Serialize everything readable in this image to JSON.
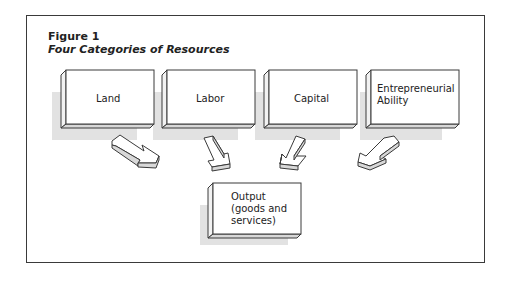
{
  "figure": {
    "number": "Figure 1",
    "title": "Four Categories of Resources"
  },
  "resources": [
    {
      "label": "Land"
    },
    {
      "label": "Labor"
    },
    {
      "label": "Capital"
    },
    {
      "label_line1": "Entrepreneurial",
      "label_line2": "Ability"
    }
  ],
  "output": {
    "line1": "Output",
    "line2": "(goods and",
    "line3": "services)"
  },
  "colors": {
    "shadow": "#e2e2e2",
    "outline": "#3a3a3a",
    "arrow_side": "#d8d8d8"
  }
}
